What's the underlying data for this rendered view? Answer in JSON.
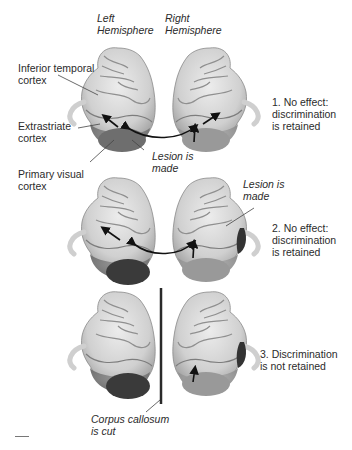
{
  "headers": {
    "left": "Left\nHemisphere",
    "right": "Right\nHemisphere"
  },
  "anatomy_labels": {
    "inferior_temporal": "Inferior temporal\ncortex",
    "extrastriate": "Extrastriate\ncortex",
    "primary_visual": "Primary visual\ncortex"
  },
  "annotations": {
    "lesion_1": "Lesion is\nmade",
    "lesion_2": "Lesion is\nmade",
    "corpus_callosum": "Corpus callosum\nis cut"
  },
  "results": [
    {
      "label": "1. No effect:\ndiscrimination\nis retained"
    },
    {
      "label": "2. No effect:\ndiscrimination\nis retained"
    },
    {
      "label": "3. Discrimination\nis not retained"
    }
  ],
  "colors": {
    "cortex_light": "#d9d9d9",
    "cortex_mid": "#a8a8a8",
    "extrastriate": "#8a8a8a",
    "lesion": "#3a3a3a",
    "arrow": "#111111",
    "cut_line": "#2a2a2a"
  }
}
